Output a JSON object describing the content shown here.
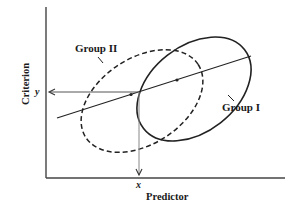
{
  "diagram": {
    "x_axis_label": "Predictor",
    "y_axis_label": "Criterion",
    "x_value_label": "x",
    "y_value_label": "y",
    "groups": [
      {
        "name": "Group I",
        "line_style": "solid"
      },
      {
        "name": "Group II",
        "line_style": "dashed"
      }
    ],
    "elements": {
      "regression_line": "common regression line",
      "arrows": [
        "from x up to regression line",
        "from regression line to y"
      ]
    }
  }
}
